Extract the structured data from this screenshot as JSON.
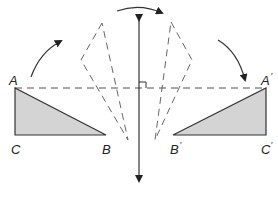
{
  "diagram": {
    "type": "reflection-across-line",
    "colors": {
      "stroke": "#333333",
      "fill": "#d4d4d4",
      "dashed": "#555555",
      "background": "#ffffff"
    },
    "original_triangle": {
      "labels": {
        "A": "A",
        "B": "B",
        "C": "C"
      }
    },
    "image_triangle": {
      "labels": {
        "A": "A",
        "B": "B",
        "C": "C"
      },
      "prime_mark": "′"
    },
    "mirror_line": {
      "orientation": "vertical",
      "arrowheads": "both"
    },
    "connector": {
      "style": "dashed",
      "right_angle_marker": true
    },
    "rotation_arrows": [
      "left-arc",
      "top-arc",
      "right-arc"
    ],
    "intermediate_positions": [
      "left-ghost-triangle",
      "right-ghost-triangle"
    ]
  }
}
